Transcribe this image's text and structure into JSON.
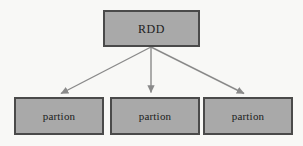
{
  "diagram": {
    "canvas": {
      "width": 303,
      "height": 146,
      "background": "#f8f8f6"
    },
    "style": {
      "node_fill": "#a9a9a9",
      "node_border": "#4a4a4a",
      "edge_color": "#8a8a8a",
      "text_color": "#1c1c1c"
    },
    "root": {
      "id": "rdd",
      "label": "RDD",
      "x": 103,
      "y": 10,
      "width": 97,
      "height": 37
    },
    "children": [
      {
        "id": "partition-0",
        "label": "partion",
        "x": 14,
        "y": 97,
        "width": 90,
        "height": 38
      },
      {
        "id": "partition-1",
        "label": "partion",
        "x": 110,
        "y": 97,
        "width": 90,
        "height": 38
      },
      {
        "id": "partition-2",
        "label": "partion",
        "x": 203,
        "y": 97,
        "width": 90,
        "height": 38
      }
    ],
    "edges": [
      {
        "id": "edge-rdd-partition-0",
        "from": "rdd",
        "to": "partition-0",
        "x1": 151,
        "y1": 47,
        "x2": 59,
        "y2": 95,
        "arrow": "arrowhead-icon"
      },
      {
        "id": "edge-rdd-partition-1",
        "from": "rdd",
        "to": "partition-1",
        "x1": 151,
        "y1": 47,
        "x2": 151,
        "y2": 95,
        "arrow": "arrowhead-icon"
      },
      {
        "id": "edge-rdd-partition-2",
        "from": "rdd",
        "to": "partition-2",
        "x1": 151,
        "y1": 47,
        "x2": 246,
        "y2": 95,
        "arrow": "arrowhead-icon"
      }
    ]
  }
}
